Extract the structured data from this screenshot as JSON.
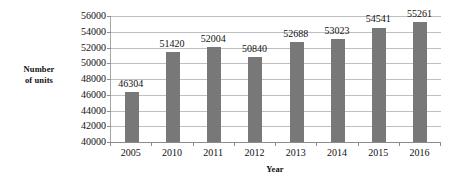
{
  "chart_data": {
    "type": "bar",
    "title": "",
    "subtitle": "",
    "xlabel": "Year",
    "ylabel": "Number of units",
    "ylabel_lines": [
      "Number",
      "of units"
    ],
    "categories": [
      "2005",
      "2010",
      "2011",
      "2012",
      "2013",
      "2014",
      "2015",
      "2016"
    ],
    "values": [
      46304,
      51420,
      52004,
      50840,
      52688,
      53023,
      54541,
      55261
    ],
    "value_labels": [
      "46304",
      "51420",
      "52004",
      "50840",
      "52688",
      "53023",
      "54541",
      "55261"
    ],
    "ylim": [
      40000,
      56000
    ],
    "ytick_step": 2000,
    "ytick_labels": [
      "56000",
      "54000",
      "52000",
      "50000",
      "48000",
      "46000",
      "44000",
      "42000",
      "40000"
    ],
    "ytick_values": [
      56000,
      54000,
      52000,
      50000,
      48000,
      46000,
      44000,
      42000,
      40000
    ],
    "grid": true,
    "grid_axis": "y",
    "legend": false,
    "legend_position": "none",
    "series": [
      {
        "name": "Number of units",
        "values": [
          46304,
          51420,
          52004,
          50840,
          52688,
          53023,
          54541,
          55261
        ],
        "color": "#787878"
      }
    ],
    "colors": {
      "bar": "#787878",
      "gridline": "#bfbfbf",
      "axis": "#8c8c8c",
      "text": "#111111",
      "background": "#ffffff"
    }
  }
}
